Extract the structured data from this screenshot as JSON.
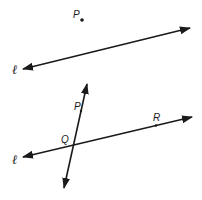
{
  "figure_top": {
    "point_label": "P",
    "line_label": "ℓ"
  },
  "figure_bottom": {
    "line_label": "ℓ",
    "transversal_point_label": "P",
    "intersection_label": "Q",
    "point_on_line_label": "R"
  },
  "colors": {
    "ink": "#1a1a1a",
    "background": "#ffffff"
  }
}
